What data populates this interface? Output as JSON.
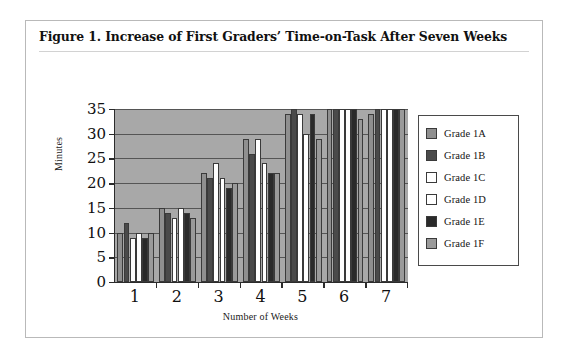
{
  "figure": {
    "title": "Figure 1.  Increase of First Graders’ Time-on-Task After Seven Weeks"
  },
  "chart_data": {
    "type": "bar",
    "title": "Increase of First Graders’ Time-on-Task After Seven Weeks",
    "xlabel": "Number of Weeks",
    "ylabel": "Minutes",
    "categories": [
      "1",
      "2",
      "3",
      "4",
      "5",
      "6",
      "7"
    ],
    "ylim": [
      0,
      35
    ],
    "yticks": [
      0,
      5,
      10,
      15,
      20,
      25,
      30,
      35
    ],
    "grid": true,
    "legend_position": "right",
    "plot_background": "#a8a8a8",
    "series": [
      {
        "name": "Grade 1A",
        "color": "#8f8f8f",
        "values": [
          10,
          15,
          22,
          29,
          34,
          35,
          34
        ]
      },
      {
        "name": "Grade 1B",
        "color": "#4a4a4a",
        "values": [
          12,
          14,
          21,
          26,
          35,
          35,
          35
        ]
      },
      {
        "name": "Grade 1C",
        "color": "#ffffff",
        "values": [
          9,
          13,
          24,
          29,
          34,
          35,
          35
        ]
      },
      {
        "name": "Grade 1D",
        "color": "#ffffff",
        "values": [
          10,
          15,
          21,
          24,
          30,
          35,
          35
        ]
      },
      {
        "name": "Grade 1E",
        "color": "#2a2a2a",
        "values": [
          9,
          14,
          19,
          22,
          34,
          35,
          35
        ]
      },
      {
        "name": "Grade 1F",
        "color": "#9a9a9a",
        "values": [
          10,
          13,
          20,
          22,
          29,
          33,
          35
        ]
      }
    ]
  }
}
